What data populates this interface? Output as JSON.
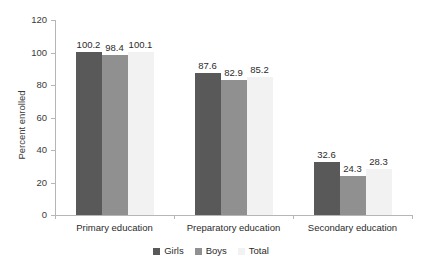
{
  "chart_data": {
    "type": "bar",
    "title": "",
    "xlabel": "",
    "ylabel": "Percent enrolled",
    "ylim": [
      0,
      120
    ],
    "yticks": [
      0,
      20,
      40,
      60,
      80,
      100,
      120
    ],
    "grid": false,
    "legend_position": "bottom",
    "categories": [
      "Primary education",
      "Preparatory education",
      "Secondary education"
    ],
    "series": [
      {
        "name": "Girls",
        "color": "#595959",
        "values": [
          100.2,
          87.6,
          32.6
        ]
      },
      {
        "name": "Boys",
        "color": "#909090",
        "values": [
          98.4,
          82.9,
          24.3
        ]
      },
      {
        "name": "Total",
        "color": "#f2f2f2",
        "values": [
          100.1,
          85.2,
          28.3
        ]
      }
    ],
    "value_labels": [
      [
        "100.2",
        "98.4",
        "100.1"
      ],
      [
        "87.6",
        "82.9",
        "85.2"
      ],
      [
        "32.6",
        "24.3",
        "28.3"
      ]
    ]
  },
  "axis": {
    "y_title": "Percent enrolled",
    "y_tick_labels": [
      "120",
      "100",
      "80",
      "60",
      "40",
      "20",
      "0"
    ]
  },
  "legend": {
    "items": [
      {
        "label": "Girls",
        "color": "#595959"
      },
      {
        "label": "Boys",
        "color": "#909090"
      },
      {
        "label": "Total",
        "color": "#f2f2f2"
      }
    ]
  },
  "title_sliver": {
    "text": ""
  }
}
